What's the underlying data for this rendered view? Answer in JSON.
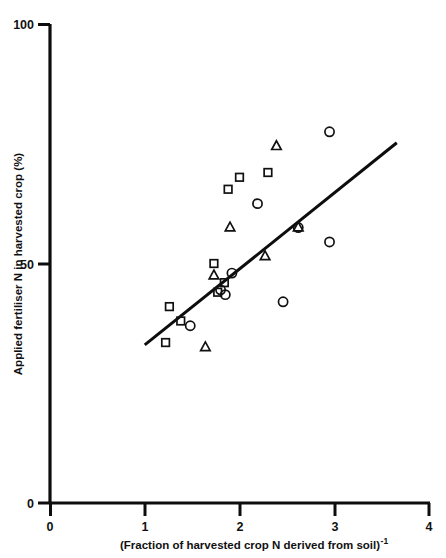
{
  "chart_data": {
    "type": "scatter",
    "title": "",
    "xlabel": "(Fraction of harvested crop N derived from soil)",
    "xlabel_superscript": "-1",
    "ylabel": "Applied fertiliser N in harvested crop (%)",
    "xlim": [
      0,
      4
    ],
    "ylim": [
      0,
      100
    ],
    "xticks": [
      0,
      1,
      2,
      3,
      4
    ],
    "xtick_labels": [
      "0",
      "1",
      "2",
      "3",
      "4"
    ],
    "yticks": [
      0,
      50,
      100
    ],
    "ytick_labels": [
      "0",
      "50",
      "100"
    ],
    "grid": false,
    "legend": "none",
    "marker_colors": {
      "stroke": "#111111",
      "fill": "none",
      "line": "#0d0d0d"
    },
    "series": [
      {
        "name": "circle",
        "marker": "circle",
        "points": [
          [
            1.48,
            37.0
          ],
          [
            1.8,
            44.5
          ],
          [
            1.85,
            43.5
          ],
          [
            1.92,
            48.0
          ],
          [
            2.19,
            62.5
          ],
          [
            2.46,
            42.0
          ],
          [
            2.62,
            57.5
          ],
          [
            2.95,
            54.5
          ],
          [
            2.95,
            77.5
          ]
        ]
      },
      {
        "name": "triangle",
        "marker": "triangle",
        "points": [
          [
            1.64,
            32.5
          ],
          [
            1.73,
            47.5
          ],
          [
            1.9,
            57.5
          ],
          [
            2.27,
            51.5
          ],
          [
            2.39,
            74.5
          ],
          [
            2.62,
            57.5
          ]
        ]
      },
      {
        "name": "square",
        "marker": "square",
        "points": [
          [
            1.22,
            33.5
          ],
          [
            1.26,
            41.0
          ],
          [
            1.38,
            38.0
          ],
          [
            1.73,
            50.0
          ],
          [
            1.77,
            44.0
          ],
          [
            1.84,
            46.0
          ],
          [
            1.88,
            65.5
          ],
          [
            2.0,
            68.0
          ],
          [
            2.3,
            69.0
          ]
        ]
      }
    ],
    "fit_line": {
      "x_start": 1.0,
      "y_start": 33.0,
      "x_end": 3.66,
      "y_end": 75.2
    }
  }
}
